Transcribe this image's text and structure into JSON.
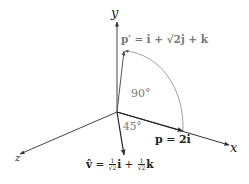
{
  "diagram": {
    "type": "3d-vector-rotation",
    "axes": {
      "x_label": "x",
      "y_label": "y",
      "z_label": "z"
    },
    "vectors": {
      "p": {
        "lhs": "p",
        "eq": " = ",
        "rhs": "2i"
      },
      "p_prime": {
        "lhs": "p′",
        "eq": " = ",
        "rhs": "i + √2j + k",
        "parts": [
          "i",
          " + ",
          "√2",
          "j",
          " + ",
          "k"
        ]
      },
      "v_hat": {
        "lhs": "v̂",
        "eq": " = ",
        "coef_num": "1",
        "coef_den": "√2",
        "term1": "i",
        "plus": " + ",
        "term2": "k"
      }
    },
    "angles": {
      "rotation": "90°",
      "axis_angle": "45°"
    },
    "colors": {
      "axis": "#333333",
      "arc": "#888888",
      "label": "#222222",
      "gray_label": "#777777"
    }
  }
}
